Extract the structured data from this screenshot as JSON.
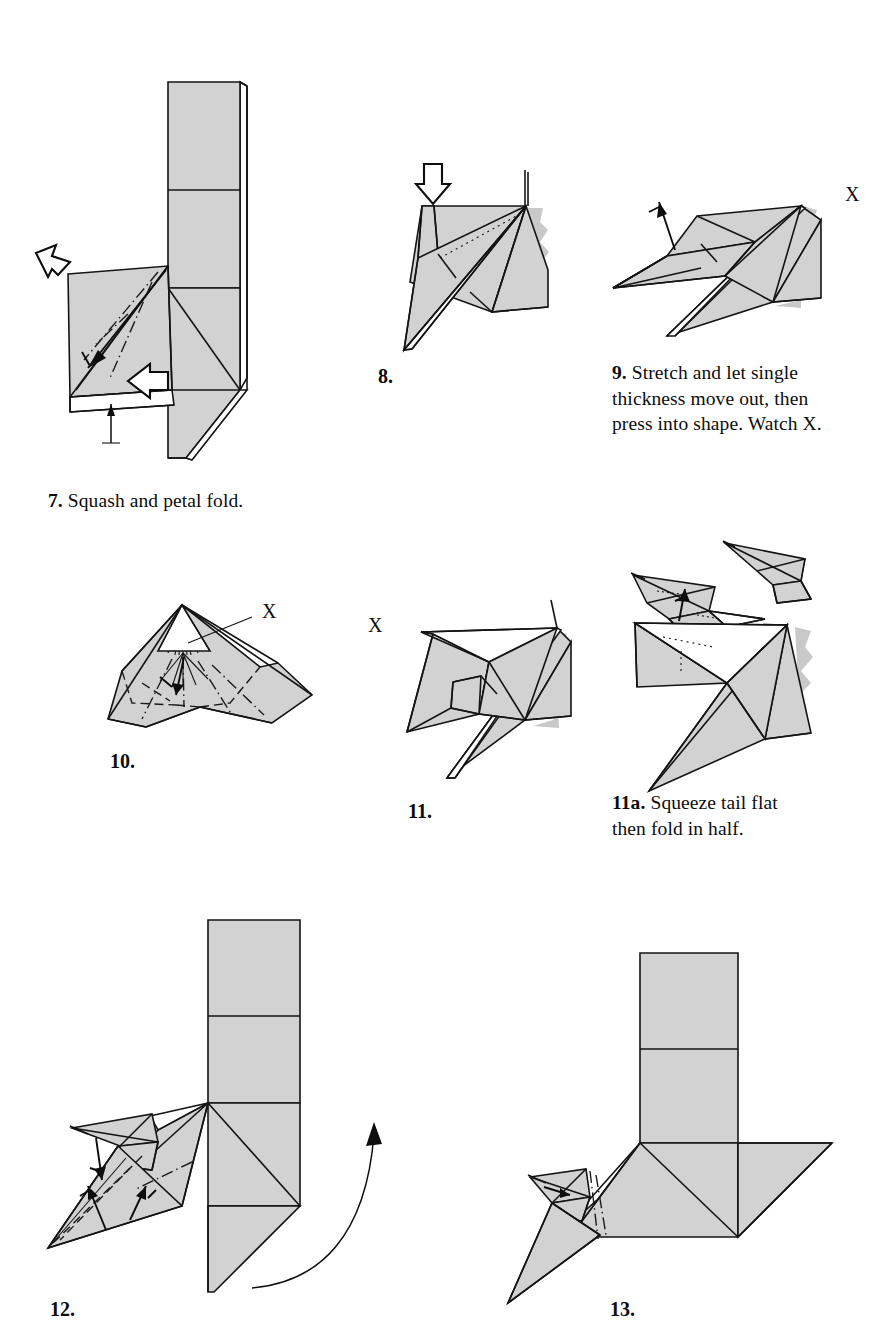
{
  "page": {
    "paper_color": "#d2d2d2",
    "line_color": "#141414",
    "background": "#ffffff",
    "width": 895,
    "height": 1340
  },
  "steps": [
    {
      "id": "step7",
      "number": "7.",
      "caption_number": "7.",
      "caption_text": "Squash and petal fold.",
      "label_only": false,
      "markers": []
    },
    {
      "id": "step8",
      "number": "8.",
      "caption_number": "8.",
      "caption_text": "",
      "label_only": true,
      "markers": []
    },
    {
      "id": "step9",
      "number": "9.",
      "caption_number": "9.",
      "caption_text": "Stretch and let single thickness move out, then press into shape. Watch X.",
      "caption_lines": [
        "Stretch and let single",
        "thickness move out, then",
        "press into shape. Watch X."
      ],
      "label_only": false,
      "markers": [
        "X"
      ]
    },
    {
      "id": "step10",
      "number": "10.",
      "caption_number": "10.",
      "caption_text": "",
      "label_only": true,
      "markers": [
        "X"
      ]
    },
    {
      "id": "step11",
      "number": "11.",
      "caption_number": "11.",
      "caption_text": "",
      "label_only": true,
      "markers": [
        "X"
      ]
    },
    {
      "id": "step11a",
      "number": "11a.",
      "caption_number": "11a.",
      "caption_text": "Squeeze tail flat then fold in half.",
      "caption_lines": [
        "Squeeze tail flat",
        "then fold in half."
      ],
      "label_only": false,
      "markers": []
    },
    {
      "id": "step12",
      "number": "12.",
      "caption_number": "12.",
      "caption_text": "",
      "label_only": true,
      "markers": []
    },
    {
      "id": "step13",
      "number": "13.",
      "caption_number": "13.",
      "caption_text": "",
      "label_only": true,
      "markers": []
    }
  ],
  "labels": {
    "step7_num": "7.",
    "step7_text": "Squash and petal fold.",
    "step8_num": "8.",
    "step9_num": "9.",
    "step9_line1": "Stretch and let single",
    "step9_line2": "thickness move out, then",
    "step9_line3": "press into shape. Watch X.",
    "step9_x": "X",
    "step10_num": "10.",
    "step10_x": "X",
    "step11_num": "11.",
    "step11_x": "X",
    "step11a_num": "11a.",
    "step11a_line1": "Squeeze tail flat",
    "step11a_line2": "then fold in half.",
    "step12_num": "12.",
    "step13_num": "13."
  }
}
